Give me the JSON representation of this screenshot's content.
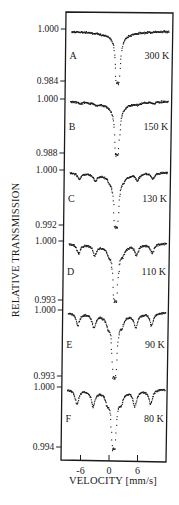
{
  "chart_data": {
    "type": "scatter",
    "title": "",
    "xlabel": "VELOCITY  [mm/s]",
    "ylabel": "RELATIVE TRANSMISSION",
    "xlim": [
      -10,
      12
    ],
    "x_ticks": [
      -6,
      0,
      6
    ],
    "x_tick_labels": [
      "-6",
      "0",
      "6"
    ],
    "grid": false,
    "legend": null,
    "panels": [
      {
        "label": "A",
        "temperature": "300 K",
        "y_ticks": [
          1.0,
          0.984
        ],
        "y_tick_labels": [
          "1.000",
          "0.984"
        ],
        "baseline": 1.0,
        "min_transmission": 0.984,
        "components": {
          "doublet_center": 0.8,
          "doublet_split": 0.5,
          "doublet_depth": 0.95,
          "sextet_depth": 0.0
        }
      },
      {
        "label": "B",
        "temperature": "150 K",
        "y_ticks": [
          1.0,
          0.988
        ],
        "y_tick_labels": [
          "1.000",
          "0.988"
        ],
        "baseline": 1.0,
        "min_transmission": 0.988,
        "components": {
          "doublet_center": 0.8,
          "doublet_split": 0.5,
          "doublet_depth": 0.95,
          "sextet_depth": 0.05
        }
      },
      {
        "label": "C",
        "temperature": "130 K",
        "y_ticks": [
          1.0,
          0.992
        ],
        "y_tick_labels": [
          "1.000",
          "0.992"
        ],
        "baseline": 1.0,
        "min_transmission": 0.992,
        "components": {
          "doublet_center": 0.8,
          "doublet_split": 0.5,
          "doublet_depth": 0.95,
          "sextet_depth": 0.2
        }
      },
      {
        "label": "D",
        "temperature": "110 K",
        "y_ticks": [
          1.0,
          0.993
        ],
        "y_tick_labels": [
          "1.000",
          "0.993"
        ],
        "baseline": 1.0,
        "min_transmission": 0.993,
        "components": {
          "doublet_center": 0.8,
          "doublet_split": 0.5,
          "doublet_depth": 0.95,
          "sextet_depth": 0.3
        }
      },
      {
        "label": "E",
        "temperature": "90 K",
        "y_ticks": [
          1.0,
          0.993
        ],
        "y_tick_labels": [
          "1.000",
          "0.993"
        ],
        "baseline": 1.0,
        "min_transmission": 0.993,
        "components": {
          "doublet_center": 0.8,
          "doublet_split": 0.5,
          "doublet_depth": 0.95,
          "sextet_depth": 0.35
        }
      },
      {
        "label": "F",
        "temperature": "80 K",
        "y_ticks": [
          1.0,
          0.994
        ],
        "y_tick_labels": [
          "1.000",
          "0.994"
        ],
        "baseline": 1.0,
        "min_transmission": 0.994,
        "components": {
          "doublet_center": 0.8,
          "doublet_split": 0.5,
          "doublet_depth": 0.95,
          "sextet_depth": 0.45
        }
      }
    ],
    "sextet_line_positions_mm_s": [
      -7.0,
      -3.6,
      -0.6,
      2.3,
      5.2,
      8.5
    ]
  },
  "colors": {
    "ink": "#1a1a1a",
    "background": "#ffffff"
  }
}
